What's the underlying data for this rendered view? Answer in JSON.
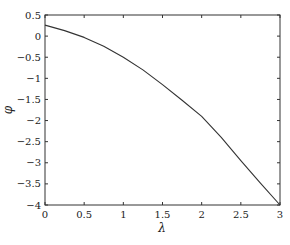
{
  "chart_data": {
    "type": "line",
    "title": "",
    "xlabel": "λ",
    "ylabel": "φ",
    "xlim": [
      0,
      3
    ],
    "ylim": [
      -4,
      0.5
    ],
    "xticks": [
      0,
      0.5,
      1,
      1.5,
      2,
      2.5,
      3
    ],
    "xtick_labels": [
      "0",
      "0.5",
      "1",
      "1.5",
      "2",
      "2.5",
      "3"
    ],
    "yticks": [
      0.5,
      0,
      -0.5,
      -1,
      -1.5,
      -2,
      -2.5,
      -3,
      -3.5,
      -4
    ],
    "ytick_labels": [
      "0.5",
      "0",
      "−0.5",
      "−1",
      "−1.5",
      "−2",
      "−2.5",
      "−3",
      "−3.5",
      "−4"
    ],
    "grid": false,
    "legend": null,
    "series": [
      {
        "name": "φ(λ)",
        "color": "#333333",
        "x": [
          0,
          0.25,
          0.5,
          0.75,
          1,
          1.25,
          1.5,
          1.75,
          2,
          2.25,
          2.5,
          2.75,
          3
        ],
        "y": [
          0.26,
          0.13,
          -0.03,
          -0.24,
          -0.5,
          -0.8,
          -1.15,
          -1.52,
          -1.9,
          -2.4,
          -2.95,
          -3.48,
          -4.0
        ]
      }
    ]
  },
  "plot_box": {
    "left": 45,
    "top": 15,
    "right": 280,
    "bottom": 205
  }
}
